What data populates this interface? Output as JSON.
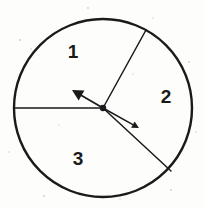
{
  "figure": {
    "kind": "spinner-diagram",
    "title": "",
    "background_color": "#fdfdfc",
    "stroke_color": "#1a1a1a",
    "circle": {
      "name": "spinner-circle",
      "center_x": 103,
      "center_y": 108,
      "radius": 89,
      "stroke_width": 2.4
    },
    "center_dot": {
      "name": "spinner-center-pivot",
      "x": 103,
      "y": 108,
      "radius": 3.2
    },
    "dividers": [
      {
        "name": "divider-left-horizontal",
        "x1": 103,
        "y1": 108,
        "x2": 14,
        "y2": 108,
        "stroke_width": 1.5
      },
      {
        "name": "divider-upper-right",
        "x1": 103,
        "y1": 108,
        "x2": 146,
        "y2": 30,
        "stroke_width": 1.5
      },
      {
        "name": "divider-lower-right",
        "x1": 103,
        "y1": 108,
        "x2": 171,
        "y2": 171,
        "stroke_width": 1.5
      }
    ],
    "arrows": [
      {
        "name": "spinner-arrow-upper-left",
        "x1": 103,
        "y1": 108,
        "x2": 72,
        "y2": 90,
        "stroke_width": 1.8,
        "head_size": 11
      },
      {
        "name": "spinner-arrow-lower-right",
        "x1": 103,
        "y1": 108,
        "x2": 139,
        "y2": 128,
        "stroke_width": 1.5,
        "head_size": 7
      }
    ],
    "sector_labels": [
      {
        "name": "sector-label-1",
        "text": "1",
        "x": 73,
        "y": 58
      },
      {
        "name": "sector-label-2",
        "text": "2",
        "x": 166,
        "y": 103
      },
      {
        "name": "sector-label-3",
        "text": "3",
        "x": 78,
        "y": 165
      }
    ],
    "specks": [
      {
        "x": 20,
        "y": 40,
        "r": 1.1
      },
      {
        "x": 31,
        "y": 49,
        "r": 0.8
      },
      {
        "x": 88,
        "y": 8,
        "r": 0.9
      },
      {
        "x": 153,
        "y": 18,
        "r": 0.8
      },
      {
        "x": 189,
        "y": 62,
        "r": 0.9
      },
      {
        "x": 196,
        "y": 132,
        "r": 0.8
      },
      {
        "x": 171,
        "y": 190,
        "r": 0.9
      },
      {
        "x": 120,
        "y": 199,
        "r": 0.8
      },
      {
        "x": 44,
        "y": 196,
        "r": 1.0
      },
      {
        "x": 9,
        "y": 152,
        "r": 0.8
      },
      {
        "x": 133,
        "y": 74,
        "r": 0.8
      },
      {
        "x": 59,
        "y": 125,
        "r": 0.7
      }
    ]
  }
}
